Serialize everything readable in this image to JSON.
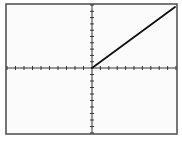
{
  "chart_data": {
    "type": "line",
    "title": "",
    "xlabel": "",
    "ylabel": "",
    "grid": false,
    "legend": null,
    "xlim": [
      -10,
      10
    ],
    "ylim": [
      -10,
      10
    ],
    "x_ticks_per_side": 10,
    "y_ticks_per_side": 10,
    "series": [
      {
        "name": "ramp",
        "x": [
          -10,
          0,
          10
        ],
        "y": [
          0,
          0,
          10
        ],
        "visible_segment": {
          "x": [
            0,
            10
          ],
          "y": [
            0,
            10
          ]
        },
        "color": "#111111"
      }
    ]
  },
  "layout": {
    "frame": {
      "x": 6,
      "y": 4,
      "w": 171,
      "h": 130
    },
    "origin": {
      "x": 92,
      "y": 68
    },
    "x_left": 7,
    "x_right": 176,
    "y_top": 5,
    "y_bottom": 133,
    "line_end": {
      "x": 175,
      "y": 7
    },
    "colors": {
      "frame": "#555555",
      "axis": "#333333",
      "line": "#111111",
      "background": "#fbfbfb"
    }
  }
}
